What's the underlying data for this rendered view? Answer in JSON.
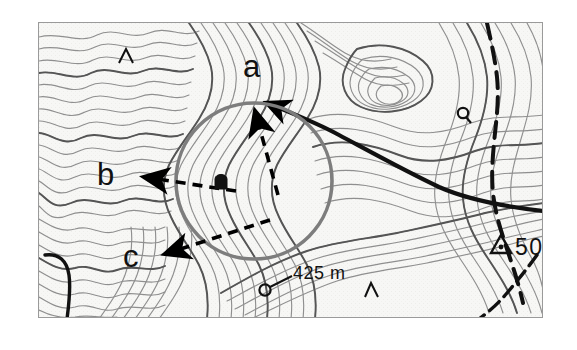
{
  "figure": {
    "type": "topographic-map-excerpt",
    "width": 577,
    "height": 350,
    "background_color": "#ffffff",
    "map_area": {
      "x": 38,
      "y": 22,
      "width": 505,
      "height": 296,
      "fill_color": "#f7f7f5",
      "border_color": "#9a9a9a"
    }
  },
  "annotations": {
    "labels": [
      {
        "id": "a",
        "text": "a",
        "x": 243,
        "y": 72,
        "font_size": 30
      },
      {
        "id": "b",
        "text": "b",
        "x": 98,
        "y": 170,
        "font_size": 30
      },
      {
        "id": "c",
        "text": "c",
        "x": 124,
        "y": 254,
        "font_size": 30
      }
    ],
    "arrows": [
      {
        "id": "arrow-a",
        "style": "dashed",
        "color": "#000000",
        "from_x": 274,
        "from_y": 185,
        "to_x": 253,
        "to_y": 103,
        "label": "a"
      },
      {
        "id": "arrow-b",
        "style": "dashed",
        "color": "#000000",
        "from_x": 232,
        "from_y": 190,
        "to_x": 140,
        "to_y": 175,
        "label": "b"
      },
      {
        "id": "arrow-c",
        "style": "dashed",
        "color": "#000000",
        "from_x": 266,
        "from_y": 219,
        "to_x": 160,
        "to_y": 252,
        "label": "c"
      }
    ],
    "circle": {
      "id": "viewpoint-circle",
      "center_x": 253,
      "center_y": 180,
      "radius": 78,
      "color": "#7a7a7a",
      "stroke_width": 3.5
    },
    "ridge_line": {
      "id": "ridge-curve",
      "color": "#000000",
      "stroke_width": 4,
      "arrowhead": "up-left"
    }
  },
  "map_symbols": {
    "spot_height": {
      "id": "spot-height-425",
      "text": "425 m",
      "x": 290,
      "y": 272,
      "marker": "circle",
      "marker_x": 265,
      "marker_y": 288
    },
    "trig_point": {
      "id": "trig-point-50",
      "text": "50",
      "symbol": "triangle-with-dot",
      "x": 500,
      "y": 243
    },
    "small_triangles": [
      {
        "id": "triangle-marker-1",
        "glyph": "Δ",
        "x": 123,
        "y": 54
      },
      {
        "id": "triangle-marker-2",
        "glyph": "Δ",
        "x": 370,
        "y": 288
      }
    ],
    "small_circles": [
      {
        "id": "circle-marker-1",
        "glyph": "Q",
        "x": 464,
        "y": 113
      },
      {
        "id": "circle-marker-2",
        "glyph": "Q",
        "x": 266,
        "y": 288
      }
    ],
    "building_symbol": {
      "id": "building-symbol",
      "x": 216,
      "y": 182
    }
  },
  "colors": {
    "contour_line": "#8c8c8c",
    "contour_index_line": "#4a4a4a",
    "path_line": "#000000",
    "annotation_gray": "#7a7a7a",
    "annotation_black": "#000000",
    "map_background": "#f7f7f5",
    "page_background": "#ffffff"
  }
}
